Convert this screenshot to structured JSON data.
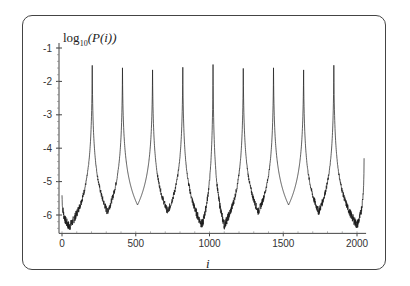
{
  "chart_data": {
    "type": "line",
    "title": "",
    "ylabel": "log10(P(i))",
    "ylabel_parts": {
      "prefix": "log",
      "sub": "10",
      "suffix": "(P(i))"
    },
    "xlabel": "i",
    "xlim": [
      0,
      2048
    ],
    "ylim": [
      -6.55,
      -0.9
    ],
    "xticks": [
      0,
      500,
      1000,
      1500,
      2000
    ],
    "yticks": [
      -1,
      -2,
      -3,
      -4,
      -5,
      -6
    ],
    "grid": false,
    "legend": null,
    "line_color": "#1a1a1a",
    "peaks": [
      {
        "i": 205,
        "value": -1.1
      },
      {
        "i": 410,
        "value": -1.2
      },
      {
        "i": 614,
        "value": -1.25
      },
      {
        "i": 819,
        "value": -1.15
      },
      {
        "i": 1024,
        "value": -1.0
      },
      {
        "i": 1229,
        "value": -1.2
      },
      {
        "i": 1434,
        "value": -1.2
      },
      {
        "i": 1638,
        "value": -1.25
      },
      {
        "i": 1843,
        "value": -1.1
      },
      {
        "i": 2048,
        "value": -4.3
      }
    ],
    "minima": [
      {
        "i": 50,
        "value": -6.35
      },
      {
        "i": 307,
        "value": -5.9
      },
      {
        "i": 512,
        "value": -5.7
      },
      {
        "i": 717,
        "value": -5.9
      },
      {
        "i": 950,
        "value": -6.3
      },
      {
        "i": 1100,
        "value": -6.3
      },
      {
        "i": 1331,
        "value": -5.9
      },
      {
        "i": 1536,
        "value": -5.7
      },
      {
        "i": 1740,
        "value": -5.9
      },
      {
        "i": 2000,
        "value": -6.3
      }
    ],
    "start_value": -5.3,
    "noise_regions_note": "dense noisy band in valleys except around i≈512 and i≈1536"
  }
}
